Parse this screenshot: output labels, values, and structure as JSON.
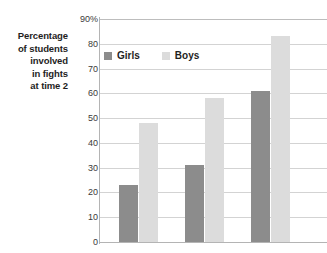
{
  "chart_data": {
    "type": "bar",
    "title": "",
    "xlabel": "",
    "ylabel": "Percentage of students involved in fights at time 2",
    "ylabel_lines": [
      "Percentage",
      "of students",
      "involved",
      "in fights",
      "at time 2"
    ],
    "categories": [
      "",
      "",
      ""
    ],
    "series": [
      {
        "name": "Girls",
        "color": "#8c8c8c",
        "values": [
          23,
          31,
          61
        ]
      },
      {
        "name": "Boys",
        "color": "#dcdcdc",
        "values": [
          48,
          58,
          83
        ]
      }
    ],
    "ylim": [
      0,
      90
    ],
    "ytick_values": [
      0,
      10,
      20,
      30,
      40,
      50,
      60,
      70,
      80,
      90
    ],
    "ytick_labels": [
      "0",
      "10",
      "20",
      "30",
      "40",
      "50",
      "60",
      "70",
      "80",
      "90%"
    ],
    "xtick_labels": [],
    "grid": "horizontal",
    "legend_position": "top-left-inside"
  },
  "legend": {
    "entries": [
      {
        "label": "Girls",
        "swatch": "girls-swatch"
      },
      {
        "label": "Boys",
        "swatch": "boys-swatch"
      }
    ]
  },
  "colors": {
    "girls": "#8c8c8c",
    "boys": "#dcdcdc",
    "gridline": "#d3d3d3",
    "axis": "#b4b4b4",
    "text": "#1e1e1e",
    "background": "#ffffff"
  }
}
